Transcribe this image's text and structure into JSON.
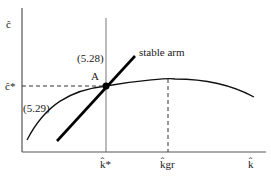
{
  "diagram": {
    "y_axis_label": "ĉ",
    "x_axis_label": "k̂",
    "y_tick_steady": "ĉ*",
    "x_tick_steady": "k̂*",
    "x_tick_golden": "k̂gr",
    "equation_vertical": "(5.28)",
    "equation_curve": "(5.29)",
    "stable_arm_label": "stable arm",
    "point_label": "A",
    "colors": {
      "axis": "#555555",
      "curve": "#111111",
      "arm": "#000000",
      "dashed": "#333333"
    }
  }
}
